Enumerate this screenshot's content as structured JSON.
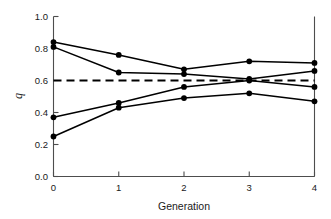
{
  "chart_data": {
    "type": "line",
    "title": "",
    "xlabel": "Generation",
    "ylabel": "q",
    "x": [
      0,
      1,
      2,
      3,
      4
    ],
    "xlim": [
      0,
      4
    ],
    "ylim": [
      0.0,
      1.0
    ],
    "xticks": [
      "0",
      "1",
      "2",
      "3",
      "4"
    ],
    "yticks": [
      "0.0",
      "0.2",
      "0.4",
      "0.6",
      "0.8",
      "1.0"
    ],
    "ytick_values": [
      0.0,
      0.2,
      0.4,
      0.6,
      0.8,
      1.0
    ],
    "grid": false,
    "legend": "none",
    "marker": "filled-circle",
    "line_color": "#000000",
    "series": [
      {
        "name": "line-1",
        "values": [
          0.84,
          0.76,
          0.67,
          0.72,
          0.71
        ]
      },
      {
        "name": "line-2",
        "values": [
          0.81,
          0.65,
          0.64,
          0.61,
          0.66
        ]
      },
      {
        "name": "line-3",
        "values": [
          0.37,
          0.46,
          0.56,
          0.6,
          0.56
        ]
      },
      {
        "name": "line-4",
        "values": [
          0.25,
          0.43,
          0.49,
          0.52,
          0.47
        ]
      }
    ],
    "reference_line": {
      "name": "equilibrium-reference",
      "orientation": "horizontal",
      "value": 0.6,
      "style": "dashed",
      "color": "#000000"
    }
  }
}
